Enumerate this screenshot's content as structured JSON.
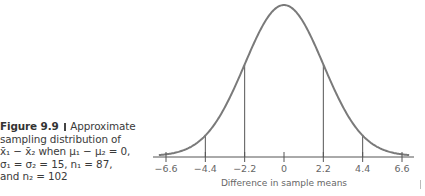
{
  "caption": {
    "label": "Figure 9.9",
    "text_line1": "Approximate",
    "text_line2": "sampling distribution of",
    "text_line3": "x̄₁ − x̄₂ when μ₁ − μ₂ = 0,",
    "text_line4": "σ₁ = σ₂ = 15, n₁ = 87,",
    "text_line5": "and n₂ = 102"
  },
  "chart_data": {
    "type": "line",
    "distribution": {
      "kind": "normal",
      "mean": 0,
      "sd": 2.2
    },
    "xlabel": "Difference in sample means",
    "ylabel": "",
    "xlim": [
      -7.2,
      7.2
    ],
    "x_ticks": [
      -6.6,
      -4.4,
      -2.2,
      0,
      2.2,
      4.4,
      6.6
    ],
    "x_tick_labels": [
      "−6.6",
      "−4.4",
      "−2.2",
      "0",
      "2.2",
      "4.4",
      "6.6"
    ],
    "reference_lines_x": [
      -4.4,
      -2.2,
      2.2,
      4.4
    ],
    "grid": false,
    "legend": null,
    "color": "#777777"
  }
}
